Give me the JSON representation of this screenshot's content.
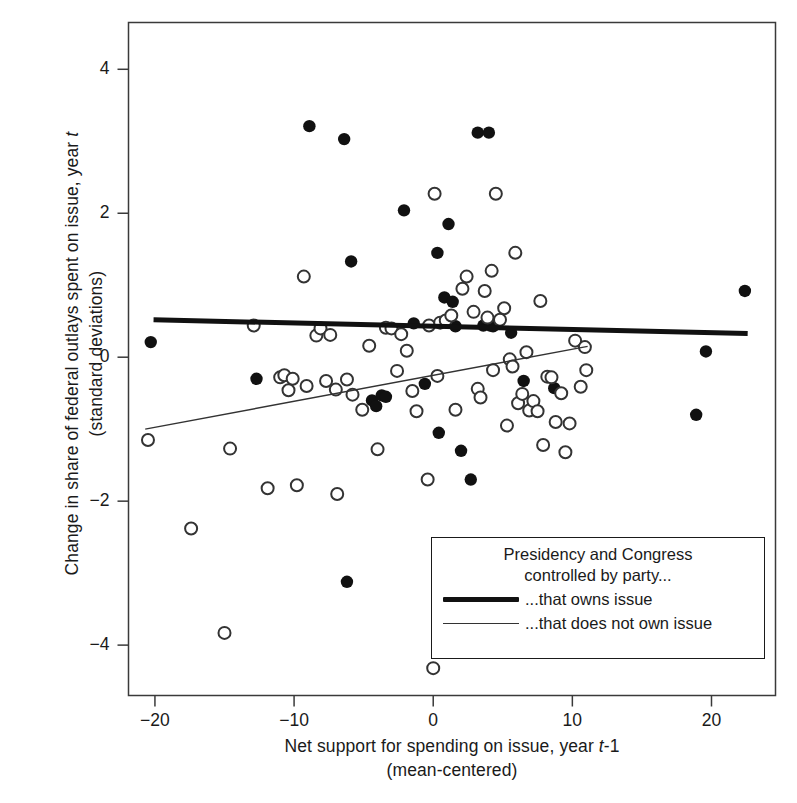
{
  "chart_data": {
    "type": "scatter",
    "title": "",
    "xlabel": "Net support for spending on issue, year t-1 (mean-centered)",
    "ylabel": "Change in share of federal outlays spent on issue, year t (standard deviations)",
    "xlim": [
      -21.9,
      24.6
    ],
    "ylim": [
      -4.7,
      4.65
    ],
    "xticks": [
      -20,
      -10,
      0,
      10,
      20
    ],
    "xtick_labels": [
      "-20",
      "-10",
      "0",
      "10",
      "20"
    ],
    "yticks": [
      4,
      2,
      0,
      -2,
      -4
    ],
    "ytick_labels": [
      "4",
      "2",
      "0",
      "-2",
      "-4"
    ],
    "grid": false,
    "legend_position": "inside-lower-right",
    "series": [
      {
        "name": "...that owns issue",
        "marker": "filled-circle",
        "color": "#111111",
        "points": [
          [
            -20.3,
            0.21
          ],
          [
            -12.7,
            -0.3
          ],
          [
            -8.9,
            3.21
          ],
          [
            -6.4,
            3.03
          ],
          [
            -6.2,
            -3.12
          ],
          [
            -5.9,
            1.33
          ],
          [
            -4.4,
            -0.6
          ],
          [
            -4.1,
            -0.68
          ],
          [
            -3.7,
            -0.53
          ],
          [
            -3.4,
            -0.55
          ],
          [
            -2.1,
            2.04
          ],
          [
            -1.4,
            0.47
          ],
          [
            -0.6,
            -0.37
          ],
          [
            0.3,
            1.45
          ],
          [
            0.4,
            -1.05
          ],
          [
            0.8,
            0.83
          ],
          [
            1.1,
            1.85
          ],
          [
            1.4,
            0.77
          ],
          [
            1.6,
            0.43
          ],
          [
            2.0,
            -1.3
          ],
          [
            2.7,
            -1.7
          ],
          [
            3.2,
            3.12
          ],
          [
            3.6,
            0.44
          ],
          [
            4.0,
            3.12
          ],
          [
            4.1,
            0.44
          ],
          [
            4.3,
            0.43
          ],
          [
            5.6,
            0.34
          ],
          [
            6.5,
            -0.33
          ],
          [
            8.7,
            -0.43
          ],
          [
            18.9,
            -0.8
          ],
          [
            19.6,
            0.08
          ],
          [
            22.4,
            0.92
          ]
        ]
      },
      {
        "name": "...that does not own issue",
        "marker": "open-circle",
        "color": "#333333",
        "points": [
          [
            -20.5,
            -1.15
          ],
          [
            -17.4,
            -2.38
          ],
          [
            -15.0,
            -3.83
          ],
          [
            -14.6,
            -1.27
          ],
          [
            -12.9,
            0.44
          ],
          [
            -11.9,
            -1.82
          ],
          [
            -11.0,
            -0.28
          ],
          [
            -10.7,
            -0.25
          ],
          [
            -10.4,
            -0.46
          ],
          [
            -10.1,
            -0.3
          ],
          [
            -9.8,
            -1.78
          ],
          [
            -9.3,
            1.12
          ],
          [
            -9.1,
            -0.4
          ],
          [
            -8.4,
            0.3
          ],
          [
            -8.1,
            0.4
          ],
          [
            -7.7,
            -0.33
          ],
          [
            -7.4,
            0.31
          ],
          [
            -7.0,
            -0.45
          ],
          [
            -6.9,
            -1.9
          ],
          [
            -6.2,
            -0.31
          ],
          [
            -5.8,
            -0.52
          ],
          [
            -5.1,
            -0.73
          ],
          [
            -4.6,
            0.16
          ],
          [
            -4.0,
            -1.28
          ],
          [
            -3.4,
            0.41
          ],
          [
            -3.0,
            0.4
          ],
          [
            -2.6,
            -0.19
          ],
          [
            -2.3,
            0.32
          ],
          [
            -1.9,
            0.09
          ],
          [
            -1.5,
            -0.47
          ],
          [
            -1.2,
            -0.75
          ],
          [
            -0.4,
            -1.7
          ],
          [
            -0.3,
            0.44
          ],
          [
            0.0,
            -4.32
          ],
          [
            0.1,
            2.27
          ],
          [
            0.3,
            -0.26
          ],
          [
            0.5,
            0.48
          ],
          [
            0.9,
            0.51
          ],
          [
            1.3,
            0.58
          ],
          [
            1.6,
            -0.73
          ],
          [
            2.1,
            0.95
          ],
          [
            2.4,
            1.12
          ],
          [
            2.9,
            0.63
          ],
          [
            3.2,
            -0.44
          ],
          [
            3.4,
            -0.56
          ],
          [
            3.7,
            0.92
          ],
          [
            3.9,
            0.55
          ],
          [
            4.2,
            1.2
          ],
          [
            4.3,
            -0.18
          ],
          [
            4.5,
            2.27
          ],
          [
            4.8,
            0.52
          ],
          [
            5.1,
            0.68
          ],
          [
            5.3,
            -0.95
          ],
          [
            5.5,
            -0.03
          ],
          [
            5.7,
            -0.13
          ],
          [
            5.9,
            1.45
          ],
          [
            6.1,
            -0.64
          ],
          [
            6.4,
            -0.51
          ],
          [
            6.7,
            0.07
          ],
          [
            6.9,
            -0.74
          ],
          [
            7.2,
            -0.61
          ],
          [
            7.5,
            -0.75
          ],
          [
            7.7,
            0.78
          ],
          [
            7.9,
            -1.22
          ],
          [
            8.2,
            -0.27
          ],
          [
            8.5,
            -0.28
          ],
          [
            8.8,
            -0.9
          ],
          [
            9.2,
            -0.5
          ],
          [
            9.5,
            -1.32
          ],
          [
            9.8,
            -0.92
          ],
          [
            10.2,
            0.23
          ],
          [
            10.6,
            -0.41
          ],
          [
            10.9,
            0.14
          ],
          [
            11.0,
            -0.18
          ]
        ]
      }
    ],
    "lines": [
      {
        "name": "...that owns issue",
        "style": "thick",
        "width_px": 5,
        "color": "#111111",
        "x_start": -20.1,
        "y_start": 0.52,
        "x_end": 22.6,
        "y_end": 0.33
      },
      {
        "name": "...that does not own issue",
        "style": "thin",
        "width_px": 1.4,
        "color": "#333333",
        "x_start": -20.7,
        "y_start": -1.0,
        "x_end": 11.1,
        "y_end": 0.15
      }
    ]
  },
  "axes": {
    "x_title_line1_a": "Net support for spending on issue, year ",
    "x_title_line1_ital": "t",
    "x_title_line1_b": "-1",
    "x_title_line2": "(mean-centered)",
    "y_title_line1_a": "Change in share of federal outlays spent on issue, year ",
    "y_title_line1_ital": "t",
    "y_title_line2": "(standard deviations)"
  },
  "legend": {
    "title_line1": "Presidency and Congress",
    "title_line2": "controlled by party...",
    "entries": [
      {
        "key": "thick-line-swatch",
        "label": "...that owns issue"
      },
      {
        "key": "thin-line-swatch",
        "label": "...that does not own issue"
      }
    ]
  }
}
